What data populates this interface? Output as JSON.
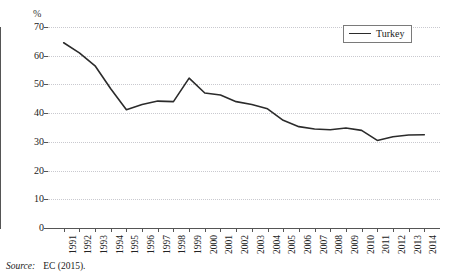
{
  "chart_data": {
    "type": "line",
    "title": "",
    "subtitle": "",
    "xlabel": "",
    "ylabel": "%",
    "unit_label": "%",
    "categories": [
      "1991",
      "1992",
      "1993",
      "1994",
      "1995",
      "1996",
      "1997",
      "1998",
      "1999",
      "2000",
      "2001",
      "2002",
      "2003",
      "2004",
      "2005",
      "2006",
      "2007",
      "2008",
      "2009",
      "2010",
      "2011",
      "2012",
      "2013",
      "2014"
    ],
    "series": [
      {
        "name": "Turkey",
        "color": "#2b2b2b",
        "values": [
          64.5,
          61.0,
          56.5,
          48.5,
          41.2,
          43.0,
          44.2,
          44.0,
          52.2,
          47.0,
          46.3,
          44.0,
          43.0,
          41.5,
          37.5,
          35.3,
          34.5,
          34.2,
          34.8,
          34.0,
          30.5,
          31.8,
          32.4,
          32.5
        ]
      }
    ],
    "ylim": [
      0,
      70
    ],
    "yticks": [
      0,
      10,
      20,
      30,
      40,
      50,
      60,
      70
    ],
    "ytick_labels": [
      "0",
      "10",
      "20",
      "30",
      "40",
      "50",
      "60",
      "70"
    ],
    "grid": true,
    "grid_axis": "y",
    "grid_style": "dotted",
    "grid_color": "#c9c9cf",
    "legend": {
      "position": "top-right",
      "entries": [
        {
          "label": "Turkey",
          "color": "#2b2b2b"
        }
      ]
    }
  },
  "source": {
    "label": "Source:",
    "text": "EC (2015)."
  }
}
